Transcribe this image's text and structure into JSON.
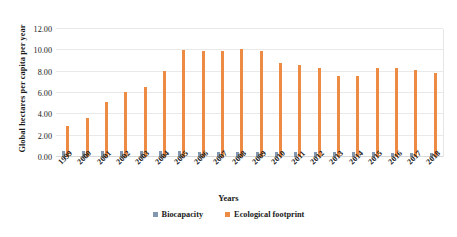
{
  "chart_data": {
    "type": "bar",
    "title": "",
    "xlabel": "Years",
    "ylabel": "Global hectares per capita per year",
    "categories": [
      "1999",
      "2000",
      "2001",
      "2002",
      "2003",
      "2004",
      "2005",
      "2006",
      "2007",
      "2008",
      "2009",
      "2010",
      "2011",
      "2012",
      "2013",
      "2014",
      "2015",
      "2016",
      "2017",
      "2018"
    ],
    "series": [
      {
        "name": "Biocapacity",
        "color": "#8497b0",
        "values": [
          0.6,
          0.55,
          0.52,
          0.55,
          0.58,
          0.58,
          0.52,
          0.5,
          0.48,
          0.5,
          0.48,
          0.48,
          0.48,
          0.45,
          0.45,
          0.45,
          0.45,
          0.42,
          0.42,
          0.42
        ]
      },
      {
        "name": "Ecological footprint",
        "color": "#ed8b45",
        "values": [
          2.9,
          3.7,
          5.2,
          6.1,
          6.6,
          8.1,
          10.0,
          9.9,
          9.9,
          10.1,
          9.9,
          8.8,
          8.6,
          8.3,
          7.6,
          7.6,
          8.3,
          8.3,
          8.2,
          7.9
        ]
      }
    ],
    "ylim": [
      0,
      12
    ],
    "yticks": [
      "0.00",
      "2.00",
      "4.00",
      "6.00",
      "8.00",
      "10.00",
      "12.00"
    ],
    "ytick_values": [
      0,
      2,
      4,
      6,
      8,
      10,
      12
    ],
    "grid": true,
    "legend_position": "bottom"
  },
  "legend": {
    "items": [
      {
        "label": "Biocapacity",
        "color": "#8497b0"
      },
      {
        "label": "Ecological footprint",
        "color": "#ed8b45"
      }
    ]
  }
}
